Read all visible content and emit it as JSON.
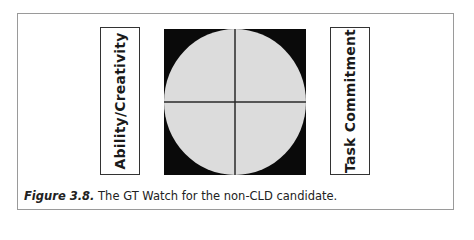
{
  "diagram": {
    "left_label": "Ability/Creativity",
    "right_label": "Task Commitment",
    "watch": {
      "background_color": "#0a0a0a",
      "circle_color": "#dcdcdc",
      "line_color": "#2a2a2a",
      "quadrants": 4
    }
  },
  "caption": {
    "figure_label": "Figure 3.8.",
    "text": " The GT Watch for the non-CLD candidate."
  }
}
